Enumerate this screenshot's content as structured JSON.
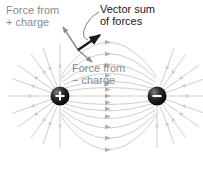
{
  "figure": {
    "labels": {
      "force_from_plus": "Force from\n+ charge",
      "vector_sum": "Vector sum\nof forces",
      "force_from_minus": "Force from\n− charge"
    },
    "charges": [
      {
        "sign": "+",
        "symbol": "+",
        "cx": 60,
        "cy": 96,
        "r": 9.5,
        "name": "positive-charge"
      },
      {
        "sign": "-",
        "symbol": "−",
        "cx": 157,
        "cy": 96,
        "r": 9.5,
        "name": "negative-charge"
      }
    ],
    "test_point": {
      "x": 78,
      "y": 50
    },
    "vectors": [
      {
        "name": "force-from-plus-vector",
        "label": "Force from + charge",
        "from": [
          78,
          50
        ],
        "to": [
          62,
          26
        ],
        "color": "#8a8a8a"
      },
      {
        "name": "vector-sum-vector",
        "label": "Vector sum of forces",
        "from": [
          78,
          50
        ],
        "to": [
          101,
          34
        ],
        "color": "#1a1a1a"
      },
      {
        "name": "force-from-minus-vector",
        "label": "Force from − charge",
        "from": [
          78,
          50
        ],
        "to": [
          92,
          63
        ],
        "color": "#8a8a8a"
      }
    ],
    "colors": {
      "field_line": "#b9b9b9",
      "label_gray": "#8a8a8a",
      "label_dark": "#1a1a1a",
      "charge_body": "#141414",
      "charge_symbol": "#ffffff",
      "background": "#ffffff"
    }
  }
}
